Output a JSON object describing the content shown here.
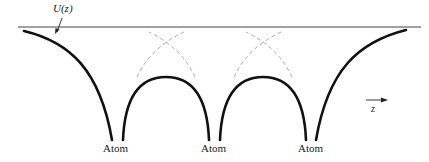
{
  "diagram": {
    "title_label": "U(z)",
    "axis_label": "z",
    "atoms": [
      {
        "label": "Atom",
        "x": 117
      },
      {
        "label": "Atom",
        "x": 214
      },
      {
        "label": "Atom",
        "x": 311
      }
    ],
    "colors": {
      "curve": "#111111",
      "vacuum_level": "#444444",
      "dashed_extension": "#aaaaaa"
    }
  }
}
